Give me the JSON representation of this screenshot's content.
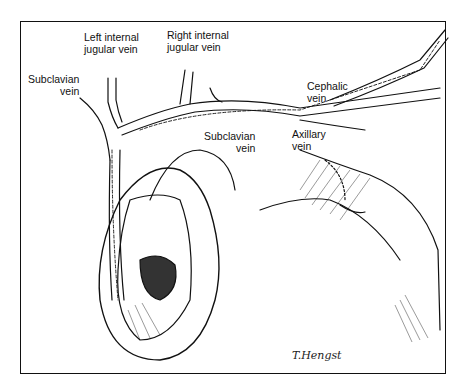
{
  "figure": {
    "type": "anatomical illustration",
    "labels": {
      "left_internal_jugular": [
        "Left internal",
        "jugular vein"
      ],
      "right_internal_jugular": [
        "Right internal",
        "jugular vein"
      ],
      "subclavian_left": [
        "Subclavian",
        "vein"
      ],
      "subclavian_right": [
        "Subclavian",
        "vein"
      ],
      "cephalic": [
        "Cephalic",
        "vein"
      ],
      "axillary": [
        "Axillary",
        "vein"
      ]
    },
    "signature": "T.Hengst",
    "colors": {
      "ink": "#111111",
      "background": "#ffffff"
    }
  }
}
